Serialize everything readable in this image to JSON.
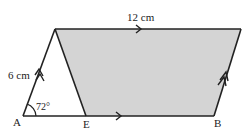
{
  "figure": {
    "type": "geometry",
    "points": {
      "A": {
        "label": "A"
      },
      "E": {
        "label": "E"
      },
      "B": {
        "label": "B"
      }
    },
    "labels": {
      "side_left": "6 cm",
      "side_top": "12 cm",
      "angle_A": "72°",
      "point_A": "A",
      "point_E": "E",
      "point_B": "B"
    },
    "colors": {
      "shade": "#d4d4d4",
      "line": "#222222"
    }
  }
}
